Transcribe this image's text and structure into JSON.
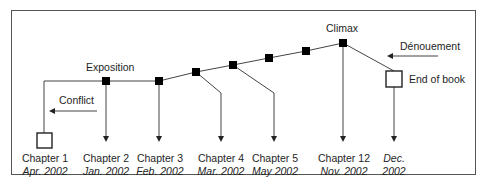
{
  "diagram": {
    "annotations": {
      "exposition": "Exposition",
      "conflict": "Conflict",
      "climax": "Climax",
      "denouement": "Dénouement",
      "end_of_book": "End of book"
    },
    "chapters": [
      {
        "name": "Chapter 1",
        "date": "Apr. 2002"
      },
      {
        "name": "Chapter 2",
        "date": "Jan. 2002"
      },
      {
        "name": "Chapter 3",
        "date": "Feb. 2002"
      },
      {
        "name": "Chapter 4",
        "date": "Mar. 2002"
      },
      {
        "name": "Chapter 5",
        "date": "May 2002"
      },
      {
        "name": "Chapter 12",
        "date": "Nov. 2002"
      },
      {
        "name": "",
        "date": "Dec. 2002",
        "date_line1": "Dec.",
        "date_line2": "2002"
      }
    ],
    "colors": {
      "line": "#444444",
      "marker": "#000000",
      "border": "#555555"
    }
  }
}
